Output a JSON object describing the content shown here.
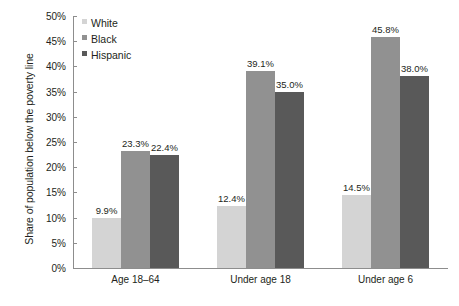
{
  "chart_data": {
    "type": "bar",
    "title": "",
    "xlabel": "",
    "ylabel": "Share of population below the poverty line",
    "categories": [
      "Age 18–64",
      "Under age 18",
      "Under age 6"
    ],
    "series": [
      {
        "name": "White",
        "color": "#d4d4d4",
        "values": [
          9.9,
          12.4,
          14.5
        ],
        "labels": [
          "9.9%",
          "12.4%",
          "14.5%"
        ]
      },
      {
        "name": "Black",
        "color": "#919191",
        "values": [
          23.3,
          39.1,
          45.8
        ],
        "labels": [
          "23.3%",
          "39.1%",
          "45.8%"
        ]
      },
      {
        "name": "Hispanic",
        "color": "#595959",
        "values": [
          22.4,
          35.0,
          38.0
        ],
        "labels": [
          "22.4%",
          "35.0%",
          "38.0%"
        ]
      }
    ],
    "ylim": [
      0,
      50
    ],
    "ytick_step": 5,
    "ytick_labels": [
      "0%",
      "5%",
      "10%",
      "15%",
      "20%",
      "25%",
      "30%",
      "35%",
      "40%",
      "45%",
      "50%"
    ],
    "grid": false,
    "legend_position": "top-left-inside",
    "value_labels_shown": true
  },
  "axis": {
    "y_title": "Share of population below the poverty line",
    "line_color": "#8d8d8d"
  },
  "legend": {
    "entries": [
      {
        "label": "White",
        "swatch": "legend-swatch-white"
      },
      {
        "label": "Black",
        "swatch": "legend-swatch-black"
      },
      {
        "label": "Hispanic",
        "swatch": "legend-swatch-hispanic"
      }
    ]
  }
}
